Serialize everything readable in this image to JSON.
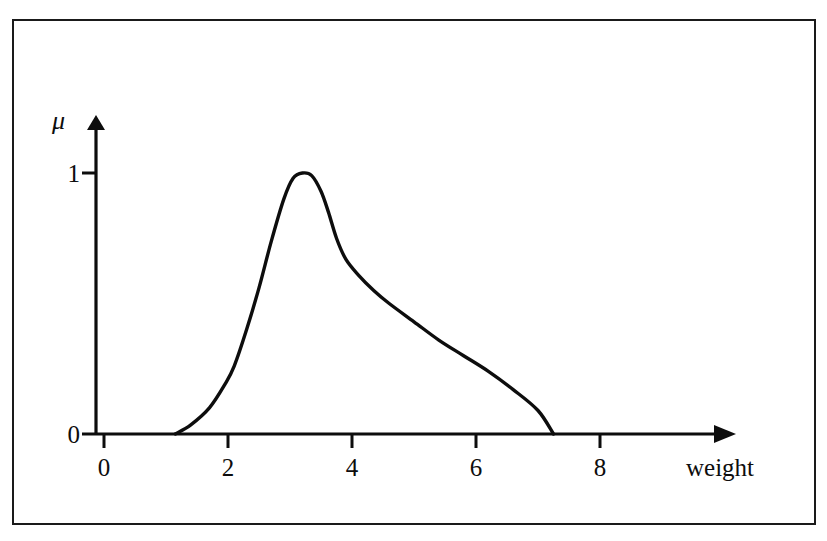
{
  "figure": {
    "background_color": "#ffffff",
    "ink_color": "#0d0d0d",
    "frame_border_color": "#1a1a1a"
  },
  "axes": {
    "x_title": "weight",
    "y_title": "μ",
    "x_ticks": [
      "0",
      "2",
      "4",
      "6",
      "8"
    ],
    "y_ticks": [
      "0",
      "1"
    ],
    "x_arrow_name": "x-axis-arrow",
    "y_arrow_name": "y-axis-arrow"
  },
  "chart_data": {
    "type": "line",
    "title": "",
    "subtitle": "",
    "xlabel": "weight",
    "ylabel": "μ",
    "xlim": [
      0,
      10
    ],
    "ylim": [
      0,
      1.12
    ],
    "x_ticks": [
      0,
      2,
      4,
      6,
      8
    ],
    "y_ticks": [
      0,
      1
    ],
    "grid": false,
    "legend": null,
    "annotations": [],
    "series": [
      {
        "name": "membership function",
        "x": [
          1.15,
          1.4,
          1.7,
          1.95,
          2.1,
          2.3,
          2.5,
          2.7,
          2.9,
          3.05,
          3.2,
          3.35,
          3.5,
          3.62,
          3.75,
          3.9,
          4.1,
          4.35,
          4.6,
          5.0,
          5.4,
          5.8,
          6.2,
          6.6,
          7.0,
          7.25
        ],
        "y": [
          0.0,
          0.035,
          0.1,
          0.19,
          0.26,
          0.4,
          0.56,
          0.74,
          0.9,
          0.98,
          1.0,
          0.99,
          0.93,
          0.85,
          0.75,
          0.67,
          0.61,
          0.55,
          0.5,
          0.43,
          0.36,
          0.3,
          0.24,
          0.17,
          0.09,
          0.0
        ]
      }
    ]
  }
}
